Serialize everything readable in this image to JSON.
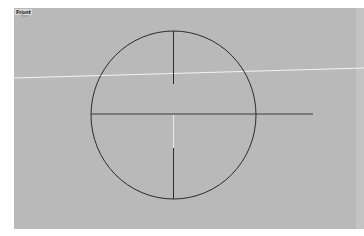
{
  "viewport": {
    "label": "Front",
    "background": "#b9b9b9"
  },
  "scene": {
    "circle": {
      "cx": 159.5,
      "cy": 107,
      "rx": 82.5,
      "ry": 84,
      "stroke": "#2a2a2a"
    },
    "horizontal_line": {
      "x1": 77,
      "y1": 106,
      "x2": 299,
      "y2": 106
    },
    "vertical_line_upper": {
      "x1": 159.5,
      "y1": 23,
      "x2": 159.5,
      "y2": 76
    },
    "vertical_line_lower": {
      "x1": 159.5,
      "y1": 140,
      "x2": 159.5,
      "y2": 191
    },
    "highlight_segment": {
      "x1": 159.5,
      "y1": 107,
      "x2": 159.5,
      "y2": 140
    },
    "construction_line": {
      "x1": 0,
      "y1": 70,
      "x2": 350,
      "y2": 60,
      "stroke": "#f4f4f4"
    }
  },
  "icons": {
    "axis": "axis-triad-icon"
  }
}
